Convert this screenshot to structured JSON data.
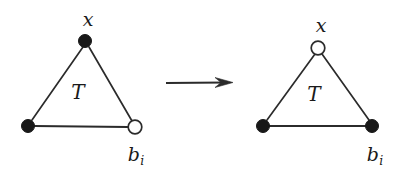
{
  "figure": {
    "caption": "",
    "background_color": "#ffffff",
    "ink_color": "#2b2b2b",
    "filled_node_color": "#181818",
    "open_node_fill": "#ffffff",
    "width": 403,
    "height": 174
  },
  "left_graph": {
    "name": "before-transformation",
    "interior_label": "T",
    "nodes": [
      {
        "id": "top",
        "label": "x",
        "state": "filled",
        "cx": 85,
        "cy": 41,
        "r": 6.5,
        "label_x": 88,
        "label_y": 26
      },
      {
        "id": "bottom-left",
        "label": "",
        "state": "filled",
        "cx": 28,
        "cy": 126,
        "r": 6.5,
        "label_x": 28,
        "label_y": 126
      },
      {
        "id": "bottom-right",
        "label": "b",
        "sub": "i",
        "state": "open",
        "cx": 135,
        "cy": 127,
        "r": 6.8,
        "label_x": 140,
        "label_y": 161
      }
    ],
    "edges": [
      {
        "from": "top",
        "to": "bottom-left"
      },
      {
        "from": "top",
        "to": "bottom-right"
      },
      {
        "from": "bottom-left",
        "to": "bottom-right"
      }
    ],
    "interior_label_x": 78,
    "interior_label_y": 99
  },
  "arrow": {
    "name": "transformation-arrow",
    "glyph": "right-arrow",
    "x1": 166,
    "x2": 233,
    "y": 83
  },
  "right_graph": {
    "name": "after-transformation",
    "interior_label": "T",
    "nodes": [
      {
        "id": "top",
        "label": "x",
        "state": "open",
        "cx": 318,
        "cy": 48,
        "r": 6.8,
        "label_x": 321,
        "label_y": 32
      },
      {
        "id": "bottom-left",
        "label": "",
        "state": "filled",
        "cx": 263,
        "cy": 126,
        "r": 6.5,
        "label_x": 263,
        "label_y": 126
      },
      {
        "id": "bottom-right",
        "label": "b",
        "sub": "i",
        "state": "filled",
        "cx": 372,
        "cy": 126,
        "r": 6.5,
        "label_x": 379,
        "label_y": 161
      }
    ],
    "edges": [
      {
        "from": "top",
        "to": "bottom-left"
      },
      {
        "from": "top",
        "to": "bottom-right"
      },
      {
        "from": "bottom-left",
        "to": "bottom-right"
      }
    ],
    "interior_label_x": 314,
    "interior_label_y": 101
  },
  "labels": {
    "x_left": "x",
    "x_right": "x",
    "T_left": "T",
    "T_right": "T",
    "b_base": "b",
    "b_subscript": "i"
  }
}
